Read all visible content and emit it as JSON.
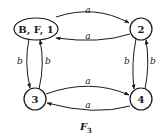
{
  "diagram": {
    "type": "state-transition-graph",
    "caption": {
      "main": "F",
      "subscript": "3"
    },
    "nodes": [
      {
        "id": "n1",
        "label": "B, F, 1",
        "shape": "ellipse"
      },
      {
        "id": "n2",
        "label": "2",
        "shape": "circle"
      },
      {
        "id": "n3",
        "label": "3",
        "shape": "circle"
      },
      {
        "id": "n4",
        "label": "4",
        "shape": "circle"
      }
    ],
    "edges": [
      {
        "from": "n1",
        "to": "n2",
        "label": "a"
      },
      {
        "from": "n2",
        "to": "n1",
        "label": "a"
      },
      {
        "from": "n1",
        "to": "n3",
        "label": "b"
      },
      {
        "from": "n3",
        "to": "n1",
        "label": "b"
      },
      {
        "from": "n2",
        "to": "n4",
        "label": "b"
      },
      {
        "from": "n4",
        "to": "n2",
        "label": "b"
      },
      {
        "from": "n3",
        "to": "n4",
        "label": "a"
      },
      {
        "from": "n4",
        "to": "n3",
        "label": "a"
      }
    ]
  }
}
